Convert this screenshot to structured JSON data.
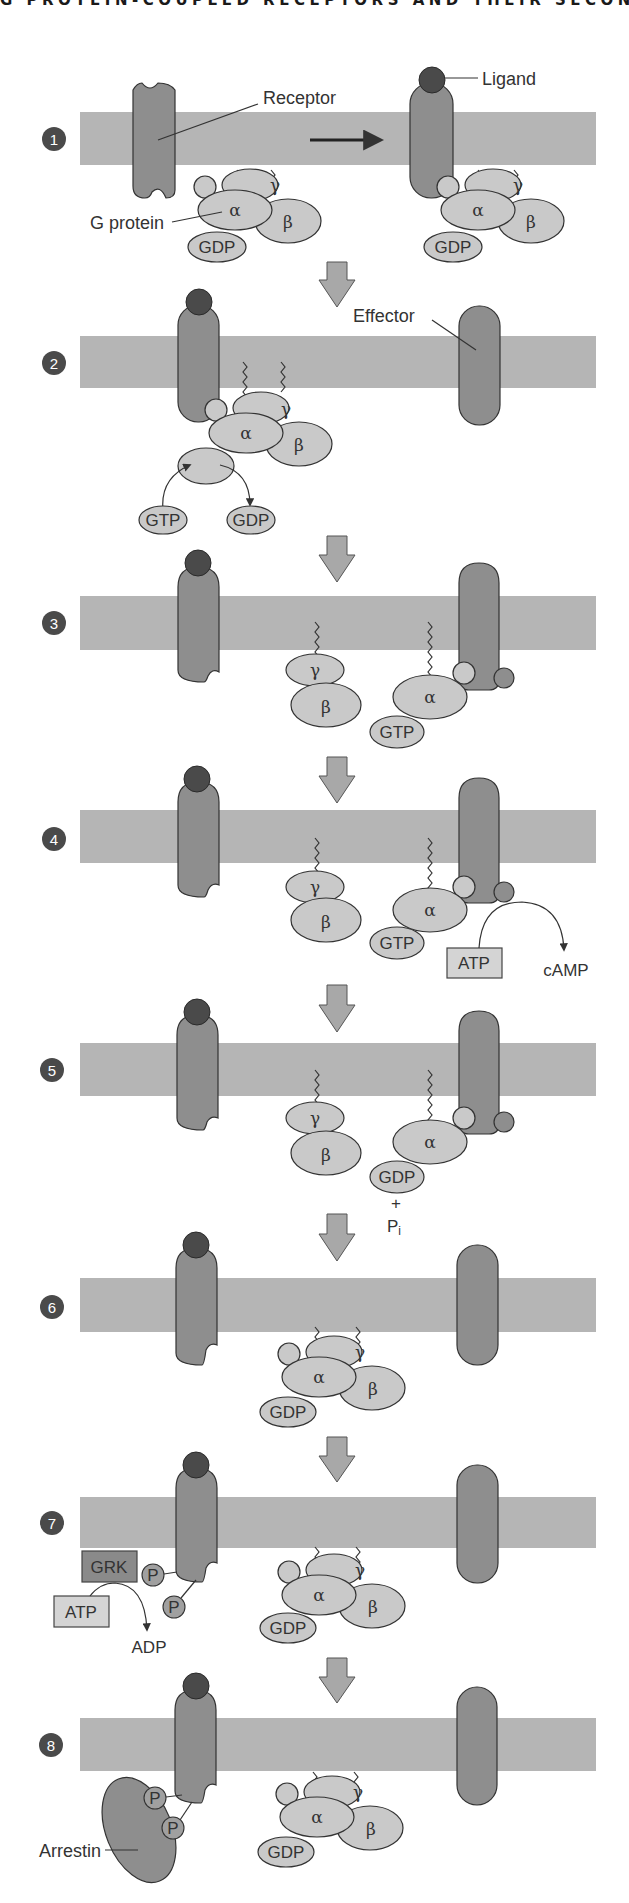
{
  "header": {
    "title": "G PROTEIN-COUPLED RECEPTORS AND THEIR SECOND MESSENGERS"
  },
  "labels": {
    "receptor": "Receptor",
    "ligand": "Ligand",
    "g_protein": "G protein",
    "effector": "Effector",
    "arrestin": "Arrestin"
  },
  "subunits": {
    "alpha": "α",
    "beta": "β",
    "gamma": "γ"
  },
  "molecules": {
    "gdp": "GDP",
    "gtp": "GTP",
    "atp": "ATP",
    "adp": "ADP",
    "camp": "cAMP",
    "plus": "+",
    "pi_base": "P",
    "pi_sub": "i",
    "phosphate": "P",
    "grk": "GRK"
  },
  "steps": [
    {
      "number": "1"
    },
    {
      "number": "2"
    },
    {
      "number": "3"
    },
    {
      "number": "4"
    },
    {
      "number": "5"
    },
    {
      "number": "6"
    },
    {
      "number": "7"
    },
    {
      "number": "8"
    }
  ],
  "colors": {
    "membrane": "#b5b5b5",
    "receptor": "#8e8e8e",
    "ligand": "#4a4a4a",
    "subunit": "#c9c9c9",
    "badge": "#4a4a4a"
  }
}
